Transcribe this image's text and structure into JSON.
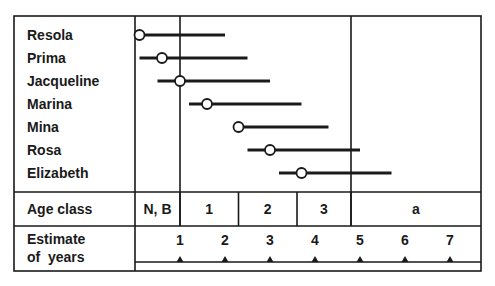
{
  "chart_data": {
    "type": "range-interval",
    "title": "",
    "xlabel": "Estimate of years",
    "ylabel": "",
    "x_ticks": [
      1,
      2,
      3,
      4,
      5,
      6,
      7
    ],
    "categories": [
      "Resola",
      "Prima",
      "Jacqueline",
      "Marina",
      "Mina",
      "Rosa",
      "Elizabeth"
    ],
    "series": [
      {
        "name": "Resola",
        "estimate": 0.1,
        "range": [
          0.1,
          2.0
        ]
      },
      {
        "name": "Prima",
        "estimate": 0.6,
        "range": [
          0.1,
          2.5
        ]
      },
      {
        "name": "Jacqueline",
        "estimate": 1.0,
        "range": [
          0.5,
          3.0
        ]
      },
      {
        "name": "Marina",
        "estimate": 1.6,
        "range": [
          1.2,
          3.7
        ]
      },
      {
        "name": "Mina",
        "estimate": 2.3,
        "range": [
          2.3,
          4.3
        ]
      },
      {
        "name": "Rosa",
        "estimate": 3.0,
        "range": [
          2.5,
          5.0
        ]
      },
      {
        "name": "Elizabeth",
        "estimate": 3.7,
        "range": [
          3.2,
          5.7
        ]
      }
    ],
    "age_classes": [
      {
        "label": "N, B",
        "from": 0,
        "to": 1
      },
      {
        "label": "1",
        "from": 1,
        "to": 2.3
      },
      {
        "label": "2",
        "from": 2.3,
        "to": 3.6
      },
      {
        "label": "3",
        "from": 3.6,
        "to": 4.8
      },
      {
        "label": "a",
        "from": 4.8,
        "to": 7.7
      }
    ],
    "reference_lines": [
      1,
      4.8
    ],
    "grid": false,
    "legend": "none"
  },
  "labels": {
    "age_class": "Age class",
    "estimate_line1": "Estimate",
    "estimate_line2": "of  years"
  },
  "colors": {
    "ink": "#1a1a1a",
    "background": "#ffffff"
  }
}
